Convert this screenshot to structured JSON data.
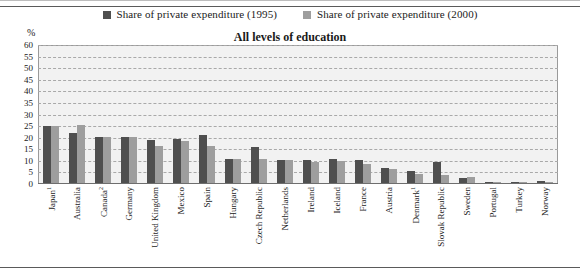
{
  "legend": {
    "items": [
      {
        "label": "Share of private expenditure (1995)",
        "color": "#4f4f4f",
        "name": "legend-swatch-1995"
      },
      {
        "label": "Share of private expenditure (2000)",
        "color": "#9e9e9e",
        "name": "legend-swatch-2000"
      }
    ]
  },
  "axis": {
    "percent_symbol": "%",
    "yticks": [
      "60",
      "55",
      "50",
      "45",
      "40",
      "35",
      "30",
      "25",
      "20",
      "15",
      "10",
      "5",
      "0"
    ]
  },
  "chart_data": {
    "type": "bar",
    "title": "All levels of education",
    "xlabel": "",
    "ylabel": "%",
    "ylim": [
      0,
      60
    ],
    "ytick_step": 5,
    "grid": true,
    "legend_position": "top",
    "categories": [
      "Japan¹",
      "Australia",
      "Canada²",
      "Germany",
      "United Kingdom",
      "Mexico",
      "Spain",
      "Hungary",
      "Czech Republic",
      "Netherlands",
      "Ireland",
      "Iceland",
      "France",
      "Austria",
      "Denmark¹",
      "Slovak Republic",
      "Sweden",
      "Portugal",
      "Turkey",
      "Norway"
    ],
    "category_footnotes": {
      "Japan": "1",
      "Canada": "2",
      "Denmark": "1"
    },
    "series": [
      {
        "name": "Share of private expenditure (1995)",
        "color": "#4f4f4f",
        "values": [
          25.0,
          22.0,
          20.5,
          20.5,
          19.0,
          19.5,
          21.0,
          11.0,
          16.0,
          10.5,
          10.5,
          11.0,
          10.5,
          7.0,
          5.5,
          9.5,
          2.5,
          1.0,
          1.0,
          1.5
        ]
      },
      {
        "name": "Share of private expenditure (2000)",
        "color": "#9e9e9e",
        "values": [
          25.0,
          25.5,
          20.5,
          20.5,
          16.5,
          18.5,
          16.5,
          11.0,
          11.0,
          10.5,
          9.5,
          10.0,
          8.5,
          6.5,
          4.5,
          4.0,
          3.0,
          1.0,
          1.0,
          1.0
        ]
      }
    ]
  }
}
